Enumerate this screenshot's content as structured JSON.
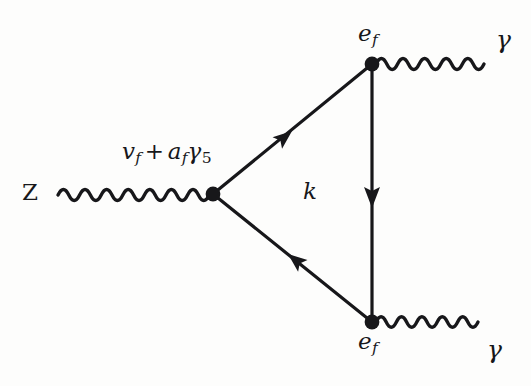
{
  "figure": {
    "kind": "feynman-diagram",
    "background_color": "#fdfdfc",
    "ink_color": "#17171a"
  },
  "labels": {
    "incoming_boson": "Z",
    "vertex_coupling": {
      "full": "v_f + a_f γ_5",
      "v_symbol": "v",
      "v_subscript": "f",
      "operator": "+",
      "a_symbol": "a",
      "a_subscript": "f",
      "gamma_symbol": "γ",
      "gamma_subscript": "5"
    },
    "loop_momentum": "k",
    "fermion_top": {
      "symbol": "e",
      "subscript": "f"
    },
    "fermion_bottom": {
      "symbol": "e",
      "subscript": "f"
    },
    "photon_top": "γ",
    "photon_bottom": "γ"
  },
  "geometry": {
    "vertex_z": {
      "x": 213,
      "y": 194,
      "radius": 7
    },
    "vertex_top": {
      "x": 372,
      "y": 64,
      "radius": 7
    },
    "vertex_bottom": {
      "x": 372,
      "y": 322,
      "radius": 7
    },
    "z_line": {
      "x1": 58,
      "y1": 195,
      "x2": 208,
      "y2": 195,
      "periods": 7,
      "amplitude": 6
    },
    "photon_top_line": {
      "x1": 378,
      "y1": 64,
      "x2": 486,
      "y2": 64,
      "periods": 5,
      "amplitude": 6
    },
    "photon_bottom_line": {
      "x1": 378,
      "y1": 322,
      "x2": 480,
      "y2": 322,
      "periods": 5,
      "amplitude": 6
    },
    "fermion_upper": {
      "x1": 213,
      "y1": 194,
      "x2": 372,
      "y2": 64,
      "arrow_direction": "toward-vertex-z"
    },
    "fermion_lower": {
      "x1": 213,
      "y1": 194,
      "x2": 372,
      "y2": 322,
      "arrow_direction": "toward-vertex-bottom"
    },
    "fermion_vertical": {
      "x1": 372,
      "y1": 322,
      "x2": 372,
      "y2": 64,
      "arrow_direction": "upward"
    },
    "line_width": 3.2
  }
}
